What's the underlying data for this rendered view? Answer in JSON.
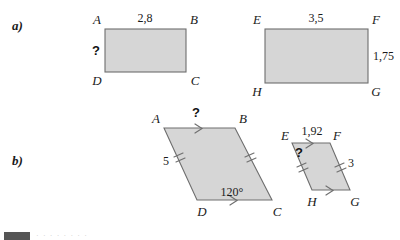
{
  "page": {
    "width": 400,
    "height": 240,
    "background": "#ffffff",
    "shape_fill": "#d6d6d6",
    "shape_stroke": "#6e6e6e",
    "text_color": "#1a1a1a"
  },
  "parts": {
    "a_label": "a)",
    "b_label": "b)"
  },
  "figures": {
    "rect_abcd": {
      "name": "rectangle-abcd",
      "vertices": {
        "A": "A",
        "B": "B",
        "C": "C",
        "D": "D"
      },
      "top_length": "2,8",
      "left_length": "?"
    },
    "rect_efgh": {
      "name": "rectangle-efgh",
      "vertices": {
        "E": "E",
        "F": "F",
        "G": "G",
        "H": "H"
      },
      "top_length": "3,5",
      "right_length": "1,75"
    },
    "para_abcd": {
      "name": "parallelogram-abcd",
      "vertices": {
        "A": "A",
        "B": "B",
        "C": "C",
        "D": "D"
      },
      "top_length": "?",
      "left_length": "5",
      "angle": "120°"
    },
    "para_efgh": {
      "name": "parallelogram-efgh",
      "vertices": {
        "E": "E",
        "F": "F",
        "G": "G",
        "H": "H"
      },
      "top_length": "1,92",
      "left_length": "?",
      "right_length": "3"
    }
  },
  "footer": {
    "text": "· · · · · · · ·"
  }
}
